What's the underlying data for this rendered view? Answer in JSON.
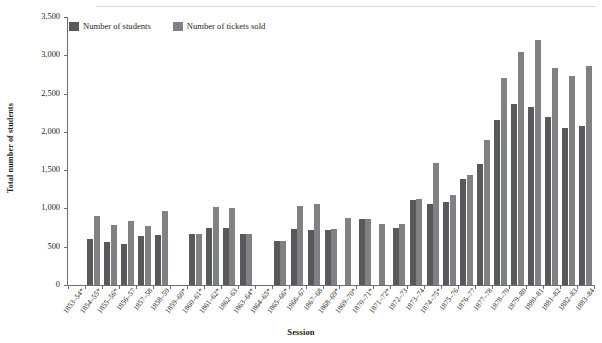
{
  "axis": {
    "y_title": "Total number of students",
    "x_title": "Session",
    "y_ticks": [
      "0",
      "500",
      "1,000",
      "1,500",
      "2,000",
      "2,500",
      "3,000",
      "3,500"
    ]
  },
  "legend": {
    "students_label": "Number of students",
    "tickets_label": "Number of tickets sold"
  },
  "colors": {
    "students": "#58595b",
    "tickets": "#808184",
    "axis": "#6d6e71",
    "text": "#231f20",
    "background": "#ffffff"
  },
  "chart_data": {
    "type": "bar",
    "title": "",
    "xlabel": "Session",
    "ylabel": "Total number of students",
    "ylim": [
      0,
      3500
    ],
    "ytick_step": 500,
    "grid": false,
    "legend_position": "top-left-inside",
    "categories": [
      "1853–54*",
      "1854–55*",
      "1855–56*",
      "1856–57",
      "1857–58",
      "1858–59",
      "1859–60*",
      "1860–61*",
      "1861–62*",
      "1862–63",
      "1863–64*",
      "1864–65*",
      "1865–66*",
      "1866–67",
      "1867–68",
      "1868–69*",
      "1869–70*",
      "1870–71*",
      "1871–72*",
      "1872–73",
      "1873–74",
      "1874–75*",
      "1875–76",
      "1876–77",
      "1877–78",
      "1878–79",
      "1879–80",
      "1880–81",
      "1881–82",
      "1882–83",
      "1883–84"
    ],
    "series": [
      {
        "name": "Number of students",
        "color": "#58595b",
        "values": [
          null,
          600,
          560,
          540,
          640,
          650,
          null,
          660,
          740,
          740,
          660,
          null,
          580,
          730,
          720,
          720,
          null,
          860,
          null,
          740,
          1110,
          1060,
          1080,
          1390,
          1580,
          2160,
          2360,
          2320,
          2200,
          2050,
          2080
        ]
      },
      {
        "name": "Number of tickets sold",
        "color": "#808184",
        "values": [
          null,
          900,
          790,
          840,
          770,
          970,
          null,
          660,
          1020,
          1010,
          660,
          null,
          580,
          1030,
          1060,
          730,
          870,
          860,
          800,
          800,
          1120,
          1600,
          1180,
          1440,
          1890,
          2710,
          3040,
          3200,
          2830,
          2730,
          2860
        ]
      }
    ]
  }
}
